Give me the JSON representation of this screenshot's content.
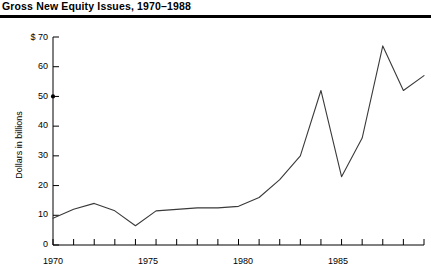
{
  "title": "Gross New Equity Issues, 1970–1988",
  "axes": {
    "ylabel": "Dollars in billions",
    "y_unit_prefix": "$",
    "ytick_labels": [
      "$ 70",
      "60",
      "50",
      "40",
      "30",
      "20",
      "10",
      "0"
    ],
    "xtick_labels": [
      "1970",
      "1975",
      "1980",
      "1985"
    ]
  },
  "colors": {
    "line": "#3a3a3a",
    "axis": "#000000",
    "rule": "#000000",
    "background": "#ffffff"
  },
  "chart_data": {
    "type": "line",
    "title": "Gross New Equity Issues, 1970–1988",
    "xlabel": "",
    "ylabel": "Dollars in billions",
    "xlim": [
      1970,
      1988
    ],
    "ylim": [
      0,
      70
    ],
    "yticks": [
      0,
      10,
      20,
      30,
      40,
      50,
      60,
      70
    ],
    "ytick_labels": [
      "0",
      "10",
      "20",
      "30",
      "40",
      "50",
      "60",
      "$ 70"
    ],
    "xticks": [
      1970,
      1971,
      1972,
      1973,
      1974,
      1975,
      1976,
      1977,
      1978,
      1979,
      1980,
      1981,
      1982,
      1983,
      1984,
      1985,
      1986,
      1987,
      1988
    ],
    "xtick_labels_shown": [
      "1970",
      "1975",
      "1980",
      "1985"
    ],
    "grid": false,
    "legend": false,
    "x": [
      1970,
      1971,
      1972,
      1973,
      1974,
      1975,
      1976,
      1977,
      1978,
      1979,
      1980,
      1981,
      1982,
      1983,
      1984,
      1985,
      1986,
      1987,
      1988
    ],
    "values": [
      9,
      12,
      14,
      11.5,
      6.5,
      11.5,
      12,
      12.5,
      12.5,
      13,
      16,
      22,
      30,
      52,
      23,
      36,
      67,
      52,
      57
    ],
    "series": [
      {
        "name": "Gross new equity issues",
        "values": [
          9,
          12,
          14,
          11.5,
          6.5,
          11.5,
          12,
          12.5,
          12.5,
          13,
          16,
          22,
          30,
          52,
          23,
          36,
          67,
          52,
          57
        ]
      }
    ]
  }
}
